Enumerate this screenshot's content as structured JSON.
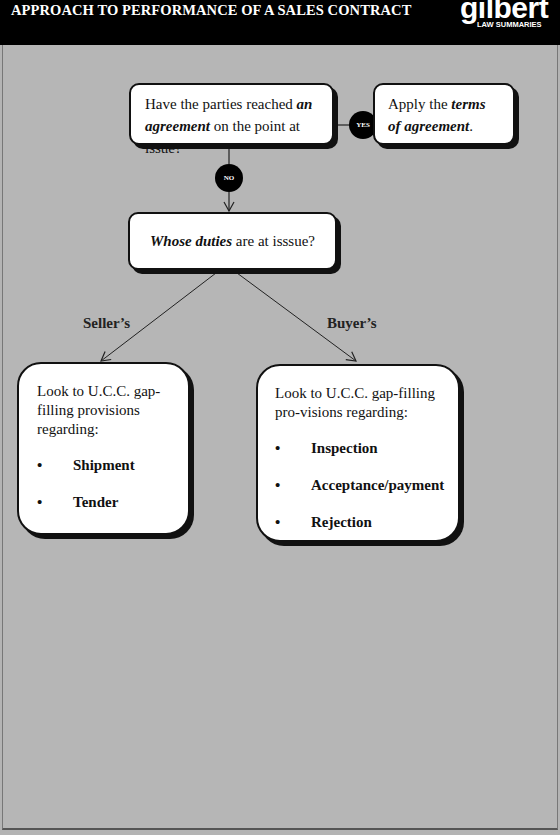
{
  "header": {
    "title": "APPROACH TO PERFORMANCE OF A SALES CONTRACT",
    "logo": {
      "name": "gilbert",
      "subtitle": "LAW SUMMARIES"
    }
  },
  "colors": {
    "header_bg": "#000000",
    "canvas_bg": "#b6b6b6",
    "box_bg": "#ffffff",
    "box_border": "#111111",
    "decision_circle": "#000000"
  },
  "flowchart": {
    "question1": {
      "text_before": "Have the parties reached ",
      "emph1": "an",
      "newline_emph": "agreement",
      "text_after": " on the point at issue?"
    },
    "yes_label": "YES",
    "no_label": "NO",
    "yes_outcome": {
      "text_before": "Apply the ",
      "emph1": "terms",
      "emph2": "of agreement",
      "text_after": "."
    },
    "question2": {
      "emph": "Whose duties",
      "text_after": " are at isssue?"
    },
    "branches": {
      "seller_label": "Seller’s",
      "buyer_label": "Buyer’s"
    },
    "seller_box": {
      "intro": "Look to U.C.C. gap-filling provisions regarding:",
      "items": [
        "Shipment",
        "Tender"
      ]
    },
    "buyer_box": {
      "intro": "Look to U.C.C. gap-filling pro-visions regarding:",
      "items": [
        "Inspection",
        "Acceptance/payment",
        "Rejection"
      ]
    }
  }
}
